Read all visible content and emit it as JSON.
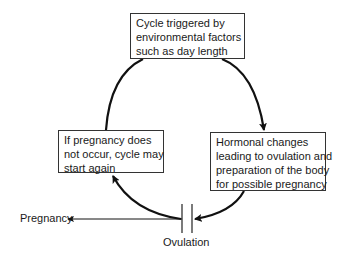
{
  "diagram": {
    "type": "cycle",
    "nodes": {
      "top": {
        "lines": [
          "Cycle triggered by",
          "environmental factors",
          "such as day length"
        ]
      },
      "right": {
        "lines": [
          "Hormonal changes",
          "leading to ovulation and",
          "preparation of the body",
          "for possible pregnancy"
        ]
      },
      "left": {
        "lines": [
          "If pregnancy does",
          "not occur, cycle may",
          "start again"
        ]
      }
    },
    "event_label": "Ovulation",
    "branch_label": "Pregnancy",
    "edges": [
      {
        "from": "top",
        "to": "right"
      },
      {
        "from": "right",
        "to": "ovulation"
      },
      {
        "from": "ovulation",
        "to": "left"
      },
      {
        "from": "left",
        "to": "top"
      },
      {
        "from": "ovulation",
        "to": "pregnancy"
      }
    ],
    "colors": {
      "line": "#111111",
      "box_border": "#333333",
      "background": "#ffffff"
    }
  }
}
